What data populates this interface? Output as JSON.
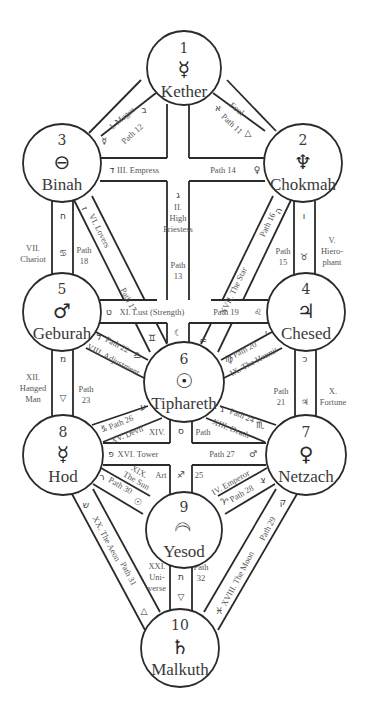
{
  "sephiroth": [
    {
      "id": "kether",
      "number": "1",
      "name": "Kether",
      "glyph": "☿",
      "glyph_name": "mercury-icon",
      "cx": 184,
      "cy": 68,
      "r": 37
    },
    {
      "id": "chokmah",
      "number": "2",
      "name": "Chokmah",
      "glyph": "♆",
      "glyph_name": "neptune-icon",
      "cx": 303,
      "cy": 163,
      "r": 39
    },
    {
      "id": "binah",
      "number": "3",
      "name": "Binah",
      "glyph": "⊖",
      "glyph_name": "earth-bar-icon",
      "cx": 62,
      "cy": 163,
      "r": 39
    },
    {
      "id": "chesed",
      "number": "4",
      "name": "Chesed",
      "glyph": "♃",
      "glyph_name": "jupiter-icon",
      "cx": 306,
      "cy": 312,
      "r": 39
    },
    {
      "id": "geburah",
      "number": "5",
      "name": "Geburah",
      "glyph": "♂",
      "glyph_name": "mars-icon",
      "cx": 62,
      "cy": 312,
      "r": 39
    },
    {
      "id": "tiphareth",
      "number": "6",
      "name": "Tiphareth",
      "glyph": "☉",
      "glyph_name": "sun-icon",
      "cx": 184,
      "cy": 382,
      "r": 40
    },
    {
      "id": "netzach",
      "number": "7",
      "name": "Netzach",
      "glyph": "♀",
      "glyph_name": "venus-icon",
      "cx": 306,
      "cy": 455,
      "r": 40
    },
    {
      "id": "hod",
      "number": "8",
      "name": "Hod",
      "glyph": "☿",
      "glyph_name": "mercury-icon",
      "cx": 63,
      "cy": 455,
      "r": 40
    },
    {
      "id": "yesod",
      "number": "9",
      "name": "Yesod",
      "glyph": "☽",
      "glyph_name": "moon-icon",
      "cx": 184,
      "cy": 530,
      "r": 38
    },
    {
      "id": "malkuth",
      "number": "10",
      "name": "Malkuth",
      "glyph": "♄",
      "glyph_name": "saturn-icon",
      "cx": 180,
      "cy": 648,
      "r": 39
    }
  ],
  "paths": [
    {
      "path": "Path 11",
      "card": "0. Fool",
      "hebrew": "א",
      "sign": "🜁",
      "from": "kether",
      "to": "chokmah"
    },
    {
      "path": "Path 12",
      "card": "I. Magus",
      "hebrew": "ב",
      "sign": "☿",
      "from": "kether",
      "to": "binah"
    },
    {
      "path": "Path 13",
      "card": "II. High Priestess",
      "hebrew": "ג",
      "sign": "☾",
      "from": "kether",
      "to": "tiphareth"
    },
    {
      "path": "Path 14",
      "card": "III. Empress",
      "hebrew": "ד",
      "sign": "♀",
      "from": "chokmah",
      "to": "binah"
    },
    {
      "path": "Path 15",
      "card": "V. Hierophant",
      "hebrew": "ו",
      "sign": "♉",
      "from": "chokmah",
      "to": "chesed"
    },
    {
      "path": "Path 16",
      "card": "XVII. The Star",
      "hebrew": "ה",
      "sign": "♒",
      "from": "chokmah",
      "to": "tiphareth"
    },
    {
      "path": "Path 17",
      "card": "VI. Lovers",
      "hebrew": "ז",
      "sign": "♊",
      "from": "binah",
      "to": "tiphareth"
    },
    {
      "path": "Path 18",
      "card": "VII. Chariot",
      "hebrew": "ח",
      "sign": "♋",
      "from": "binah",
      "to": "geburah"
    },
    {
      "path": "Path 19",
      "card": "XI. Lust (Strength)",
      "hebrew": "ט",
      "sign": "♌",
      "from": "chesed",
      "to": "geburah"
    },
    {
      "path": "Path 20",
      "card": "IX. The Hermit",
      "hebrew": "י",
      "sign": "♍",
      "from": "chesed",
      "to": "tiphareth"
    },
    {
      "path": "Path 21",
      "card": "X. Fortune",
      "hebrew": "כ",
      "sign": "♃",
      "from": "chesed",
      "to": "netzach"
    },
    {
      "path": "Path 22",
      "card": "VIII. Adjustment",
      "hebrew": "ל",
      "sign": "♎",
      "from": "geburah",
      "to": "tiphareth"
    },
    {
      "path": "Path 23",
      "card": "XII. Hanged Man",
      "hebrew": "מ",
      "sign": "🜄",
      "from": "geburah",
      "to": "hod"
    },
    {
      "path": "Path 24",
      "card": "XIII. Death",
      "hebrew": "נ",
      "sign": "♏",
      "from": "tiphareth",
      "to": "netzach"
    },
    {
      "path": "Path 25",
      "card": "XIV. Art",
      "hebrew": "ס",
      "sign": "♐",
      "from": "tiphareth",
      "to": "yesod"
    },
    {
      "path": "Path 26",
      "card": "XV. Devil",
      "hebrew": "ע",
      "sign": "♑",
      "from": "tiphareth",
      "to": "hod"
    },
    {
      "path": "Path 27",
      "card": "XVI. Tower",
      "hebrew": "פ",
      "sign": "♂",
      "from": "netzach",
      "to": "hod"
    },
    {
      "path": "Path 28",
      "card": "IV. Emperor",
      "hebrew": "צ",
      "sign": "♈",
      "from": "netzach",
      "to": "yesod"
    },
    {
      "path": "Path 29",
      "card": "XVIII. The Moon",
      "hebrew": "ק",
      "sign": "♓",
      "from": "netzach",
      "to": "malkuth"
    },
    {
      "path": "Path 30",
      "card": "XIX. The Sun",
      "hebrew": "ר",
      "sign": "☉",
      "from": "hod",
      "to": "yesod"
    },
    {
      "path": "Path 31",
      "card": "XX. The Aeon",
      "hebrew": "ש",
      "sign": "🜂",
      "from": "hod",
      "to": "malkuth"
    },
    {
      "path": "Path 32",
      "card": "XXI. Universe",
      "hebrew": "ת",
      "sign": "🜃",
      "from": "yesod",
      "to": "malkuth"
    }
  ],
  "labels": {
    "p11_card": "Fool",
    "p11_path": "Path 11",
    "p11_heb": "א",
    "p11_sym": "△",
    "p12_card": "I. Magus",
    "p12_path": "Path 12",
    "p12_heb": "ב",
    "p12_sym": "☿",
    "p13_card_1": "II.",
    "p13_card_2": "High",
    "p13_card_3": "Priestess",
    "p13_path_1": "Path",
    "p13_path_2": "13",
    "p13_heb": "ג",
    "p13_sym": "☾",
    "p14_card": "III. Empress",
    "p14_path": "Path 14",
    "p14_heb": "ד",
    "p14_sym": "♀",
    "p15_card_1": "V.",
    "p15_card_2": "Hiero-",
    "p15_card_3": "phant",
    "p15_path_1": "Path",
    "p15_path_2": "15",
    "p15_heb": "ו",
    "p15_sym": "♉",
    "p16_card": "XVII. The Star",
    "p16_path": "Path 16",
    "p16_heb": "ה",
    "p16_sym": "♒",
    "p17_card": "VI. Lovers",
    "p17_path": "Path 17",
    "p17_heb": "ז",
    "p17_sym": "♊",
    "p18_card_1": "VII.",
    "p18_card_2": "Chariot",
    "p18_path_1": "Path",
    "p18_path_2": "18",
    "p18_heb": "ח",
    "p18_sym": "♋",
    "p19_card": "XI. Lust (Strength)",
    "p19_path": "Path 19",
    "p19_heb": "ט",
    "p19_sym": "♌",
    "p20_card": "IX. The Hermit",
    "p20_path": "Path 20",
    "p20_heb": "י",
    "p20_sym": "♍",
    "p21_card_1": "X.",
    "p21_card_2": "Fortune",
    "p21_path_1": "Path",
    "p21_path_2": "21",
    "p21_heb": "כ",
    "p21_sym": "♃",
    "p22_card": "VIII. Adjustment",
    "p22_path": "Path 22",
    "p22_heb": "ל",
    "p22_sym": "♎",
    "p23_card_1": "XII.",
    "p23_card_2": "Hanged",
    "p23_card_3": "Man",
    "p23_path_1": "Path",
    "p23_path_2": "23",
    "p23_heb": "מ",
    "p23_sym": "▽",
    "p24_card": "XIII. Death",
    "p24_path": "Path 24",
    "p24_heb": "נ",
    "p24_sym": "♏",
    "p25_card_1": "XIV.",
    "p25_card_2": "Art",
    "p25_path_1": "Path",
    "p25_path_2": "25",
    "p25_heb": "ס",
    "p25_sym": "♐",
    "p26_card": "XV. Devil",
    "p26_path": "Path 26",
    "p26_heb": "ע",
    "p26_sym": "♑",
    "p27_card": "XVI. Tower",
    "p27_path": "Path 27",
    "p27_heb": "פ",
    "p27_sym": "♂",
    "p28_card": "IV. Emperor",
    "p28_path": "Path 28",
    "p28_heb": "צ",
    "p28_sym": "♈",
    "p29_card": "XVIII. The Moon",
    "p29_path": "Path 29",
    "p29_heb": "ק",
    "p29_sym": "♓",
    "p30_card_1": "XIX.",
    "p30_card_2": "The Sun",
    "p30_path": "Path 30",
    "p30_heb": "ר",
    "p30_sym": "☉",
    "p31_card": "XX. The Aeon",
    "p31_path": "Path 31",
    "p31_heb": "ש",
    "p31_sym": "△",
    "p32_card_1": "XXI.",
    "p32_card_2": "Uni-",
    "p32_card_3": "verse",
    "p32_path_1": "Path",
    "p32_path_2": "32",
    "p32_heb": "ת",
    "p32_sym": "▽"
  }
}
